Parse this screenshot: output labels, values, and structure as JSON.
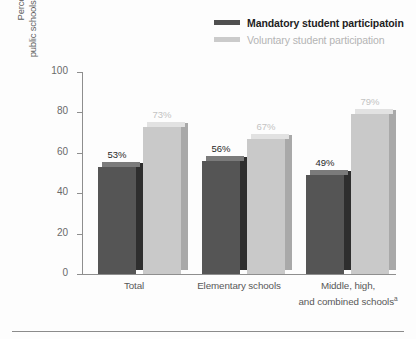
{
  "chart_data": {
    "type": "bar",
    "title": "",
    "subtitle": "",
    "xlabel": "",
    "ylabel": "Percentage of all public schools with service-learning",
    "ylabel_lines": [
      "Percentage of all",
      "public schools with service-learning"
    ],
    "ylim": [
      0,
      100
    ],
    "yticks": [
      0,
      20,
      40,
      60,
      80,
      100
    ],
    "ytick_labels": [
      "0",
      "20",
      "40",
      "60",
      "80",
      "100"
    ],
    "grid": false,
    "legend_position": "top-right",
    "categories": [
      "Total",
      "Elementary schools",
      "Middle, high, and combined schools"
    ],
    "category_lines": [
      [
        "Total"
      ],
      [
        "Elementary schools"
      ],
      [
        "Middle, high,",
        "and combined schools"
      ]
    ],
    "category_footnotes": [
      "",
      "",
      "a"
    ],
    "series": [
      {
        "name": "Mandatory student participatoin",
        "color": "#555555",
        "values": [
          53,
          56,
          49
        ],
        "value_labels": [
          "53%",
          "56%",
          "49%"
        ]
      },
      {
        "name": "Voluntary student participation",
        "color": "#c9c9c9",
        "values": [
          73,
          67,
          79
        ],
        "value_labels": [
          "73%",
          "67%",
          "79%"
        ]
      }
    ]
  },
  "legend": {
    "items": [
      {
        "label": "Mandatory student participatoin",
        "swatch_color": "#4f4f4f",
        "key": "mandatory"
      },
      {
        "label": "Voluntary student participation",
        "swatch_color": "#cbcbcb",
        "key": "voluntary"
      }
    ]
  },
  "axis": {
    "y_title_line1": "Percentage of all",
    "y_title_line2": "public schools with service-learning",
    "y_ticks": [
      "100",
      "80",
      "60",
      "40",
      "20",
      "0"
    ]
  },
  "bars": [
    {
      "group": 0,
      "series": 0,
      "label": "53%",
      "value": 53
    },
    {
      "group": 0,
      "series": 1,
      "label": "73%",
      "value": 73
    },
    {
      "group": 1,
      "series": 0,
      "label": "56%",
      "value": 56
    },
    {
      "group": 1,
      "series": 1,
      "label": "67%",
      "value": 67
    },
    {
      "group": 2,
      "series": 0,
      "label": "49%",
      "value": 49
    },
    {
      "group": 2,
      "series": 1,
      "label": "79%",
      "value": 79
    }
  ],
  "categories_display": [
    {
      "line1": "Total",
      "line2": "",
      "footnote": ""
    },
    {
      "line1": "Elementary schools",
      "line2": "",
      "footnote": ""
    },
    {
      "line1": "Middle, high,",
      "line2": "and combined schools",
      "footnote": "a"
    }
  ]
}
